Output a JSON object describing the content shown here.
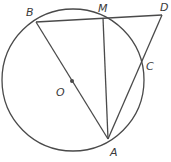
{
  "diagram": {
    "type": "geometry",
    "colors": {
      "stroke": "#4a4a4a",
      "label": "#3a3a3a",
      "background": "#ffffff"
    },
    "circle": {
      "center": "O",
      "cx": 73,
      "cy": 80,
      "r": 71
    },
    "points": [
      {
        "name": "B",
        "x": 36,
        "y": 22,
        "label": "B",
        "lx": 26,
        "ly": 16
      },
      {
        "name": "M",
        "x": 103,
        "y": 18,
        "label": "M",
        "lx": 98,
        "ly": 12
      },
      {
        "name": "D",
        "x": 162,
        "y": 15,
        "label": "D",
        "lx": 160,
        "ly": 11
      },
      {
        "name": "C",
        "x": 142,
        "y": 65,
        "label": "C",
        "lx": 146,
        "ly": 70
      },
      {
        "name": "A",
        "x": 108,
        "y": 139,
        "label": "A",
        "lx": 110,
        "ly": 156
      },
      {
        "name": "O",
        "x": 72,
        "y": 81,
        "label": "O",
        "lx": 56,
        "ly": 96
      }
    ],
    "segments": [
      {
        "from": "B",
        "to": "D"
      },
      {
        "from": "B",
        "to": "A"
      },
      {
        "from": "M",
        "to": "A"
      },
      {
        "from": "A",
        "to": "D"
      }
    ]
  }
}
